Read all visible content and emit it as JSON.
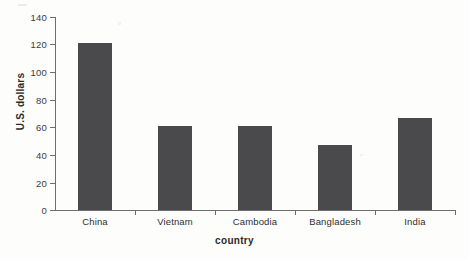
{
  "chart_data": {
    "type": "bar",
    "title": "",
    "xlabel": "country",
    "ylabel": "U.S. dollars",
    "categories": [
      "China",
      "Vietnam",
      "Cambodia",
      "Bangladesh",
      "India"
    ],
    "values": [
      121,
      61,
      61,
      47,
      67
    ],
    "ylim": [
      0,
      140
    ],
    "yticks": [
      0,
      20,
      40,
      60,
      80,
      100,
      120,
      140
    ],
    "ytick_labels": [
      "0",
      "20",
      "40",
      "60",
      "80",
      "100",
      "120",
      "140"
    ],
    "grid": false,
    "legend": null,
    "legend_position": "none",
    "series": [
      {
        "name": "U.S. dollars",
        "values": [
          121,
          61,
          61,
          47,
          67
        ],
        "color": "#4a4a4d"
      }
    ],
    "colors": {
      "bar": "#4a4a4d",
      "axis": "#6e6e6e",
      "text": "#2f2f2f",
      "background": "#fdfdfc"
    }
  }
}
